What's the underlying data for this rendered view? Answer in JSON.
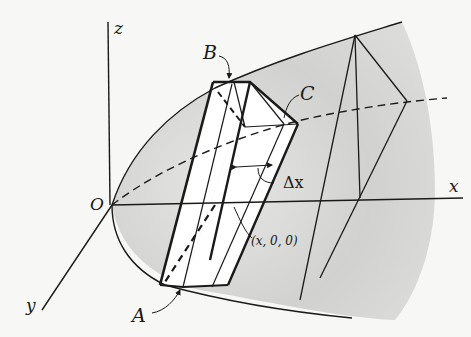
{
  "figure": {
    "colors": {
      "background": "#f7f7f5",
      "shade": "#cfcfcf",
      "line": "#1a1a1a"
    }
  },
  "labels": {
    "z": "z",
    "x": "x",
    "y": "y",
    "origin": "O",
    "B": "B",
    "C": "C",
    "A": "A",
    "delta_x": "Δx",
    "point": "(x, 0, 0)"
  }
}
